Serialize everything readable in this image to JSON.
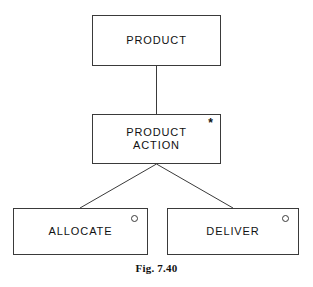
{
  "figure": {
    "caption": "Fig. 7.40",
    "background_color": "#ffffff",
    "line_color": "#3a3a3a",
    "text_color": "#111111"
  },
  "diagram": {
    "type": "entity-hierarchy",
    "nodes": [
      {
        "id": "product",
        "label": "PRODUCT",
        "marker": "none",
        "marker_glyph": ""
      },
      {
        "id": "product-action",
        "label": "PRODUCT\nACTION",
        "marker": "asterisk",
        "marker_glyph": "*"
      },
      {
        "id": "allocate",
        "label": "ALLOCATE",
        "marker": "circle",
        "marker_glyph": ""
      },
      {
        "id": "deliver",
        "label": "DELIVER",
        "marker": "circle",
        "marker_glyph": ""
      }
    ],
    "edges": [
      {
        "from": "product",
        "to": "product-action"
      },
      {
        "from": "product-action",
        "to": "allocate"
      },
      {
        "from": "product-action",
        "to": "deliver"
      }
    ]
  }
}
